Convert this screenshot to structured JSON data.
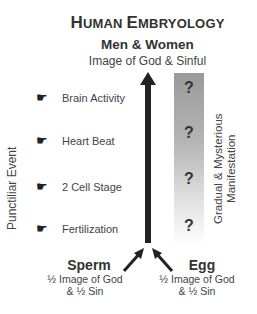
{
  "header": {
    "title_cap1": "H",
    "title_rest1": "UMAN ",
    "title_cap2": "E",
    "title_rest2": "MBRYOLOGY",
    "subtitle": "Men & Women",
    "tagline": "Image of God & Sinful"
  },
  "left_axis_label": "Punctiliar Event",
  "right_axis_label_line1": "Gradual & Mysterious",
  "right_axis_label_line2": "Manifestation",
  "events": [
    {
      "label": "Brain Activity",
      "icon": "pointing-hand-icon"
    },
    {
      "label": "Heart Beat",
      "icon": "pointing-hand-icon"
    },
    {
      "label": "2 Cell Stage",
      "icon": "pointing-hand-icon"
    },
    {
      "label": "Fertilization",
      "icon": "pointing-hand-icon"
    }
  ],
  "question_marks": [
    "?",
    "?",
    "?",
    "?"
  ],
  "hand_glyph": "☛",
  "sperm": {
    "title": "Sperm",
    "line1": "½ Image of God",
    "line2": "& ½ Sin"
  },
  "egg": {
    "title": "Egg",
    "line1": "½ Image of God",
    "line2": "& ½ Sin"
  },
  "colors": {
    "arrow": "#222222",
    "gradient_top": "#9a9a9a",
    "gradient_bottom": "#ffffff"
  }
}
